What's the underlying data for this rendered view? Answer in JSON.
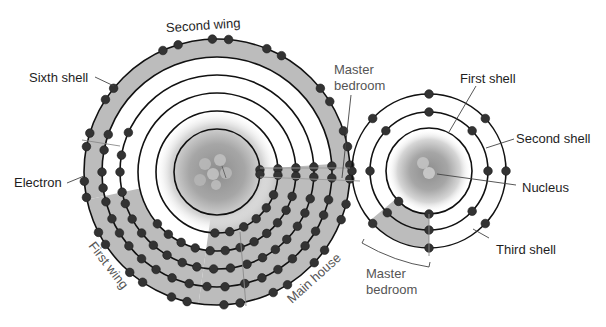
{
  "colors": {
    "ring": "#111111",
    "electron": "#333333",
    "electron_stroke": "#1a1a1a",
    "shade": "#bcbcbc",
    "divider": "#8a8a8a",
    "leader": "#444444",
    "label_dark": "#1e1e1e",
    "label_grey": "#555555"
  },
  "big_atom": {
    "cx": 217,
    "cy": 172,
    "radii": [
      43,
      61,
      79,
      97,
      115,
      133
    ],
    "nucleus_radius": 43,
    "regions": [
      {
        "name": "second-wing",
        "r_inner": 115,
        "r_outer": 133,
        "start": 168,
        "end": 372
      },
      {
        "name": "first-wing",
        "r_inner": 79,
        "r_outer": 133,
        "start": 98,
        "end": 168
      },
      {
        "name": "main-house",
        "r_inner": 43,
        "r_outer": 133,
        "start": 0,
        "end": 98
      },
      {
        "name": "master-bedroom",
        "r_inner": 43,
        "r_outer": 133,
        "start": -4,
        "end": 4
      }
    ],
    "electrons": [
      {
        "r": 43,
        "angles": [
          -3,
          3
        ]
      },
      {
        "r": 61,
        "angles": [
          -3,
          3,
          22,
          36,
          50,
          64,
          78,
          92
        ]
      },
      {
        "r": 79,
        "angles": [
          -3,
          3,
          18,
          29,
          40,
          51,
          62,
          73,
          84,
          95,
          106,
          117,
          128,
          139
        ]
      },
      {
        "r": 97,
        "angles": [
          -3,
          3,
          16,
          25,
          34,
          44,
          53,
          62,
          72,
          82,
          92,
          102,
          111,
          121,
          131,
          141,
          151,
          161,
          168,
          180,
          190,
          204
        ]
      },
      {
        "r": 115,
        "angles": [
          -3,
          3,
          14,
          22,
          31,
          40,
          49,
          58,
          67,
          76,
          86,
          95,
          104,
          113,
          122,
          131,
          140,
          148,
          156,
          165,
          172,
          180,
          191,
          199
        ]
      },
      {
        "r": 133,
        "angles": [
          -3,
          3,
          14,
          21,
          36,
          43,
          58,
          65,
          80,
          87,
          103,
          110,
          124,
          131,
          147,
          153,
          169,
          176,
          191,
          197,
          213,
          219,
          246,
          253,
          268,
          275,
          292,
          299,
          321,
          328,
          342,
          349
        ]
      }
    ]
  },
  "small_atom": {
    "cx": 429,
    "cy": 171,
    "radii": [
      43,
      59,
      77
    ],
    "nucleus_radius": 43,
    "regions": [
      {
        "name": "master-bedroom",
        "r_inner": 43,
        "r_outer": 77,
        "start": 90,
        "end": 140
      }
    ],
    "electrons": [
      {
        "r": 43,
        "angles": [
          90,
          135
        ]
      },
      {
        "r": 59,
        "angles": [
          -90,
          -43,
          0,
          43,
          90,
          135,
          180,
          223
        ]
      },
      {
        "r": 77,
        "angles": [
          -90,
          -43,
          0,
          43,
          90,
          137,
          180,
          223
        ]
      }
    ]
  },
  "labels": {
    "second_wing": "Second wing",
    "sixth_shell": "Sixth shell",
    "electron": "Electron",
    "first_wing": "First wing",
    "main_house": "Main house",
    "master_bedroom_top_line1": "Master",
    "master_bedroom_top_line2": "bedroom",
    "first_shell": "First shell",
    "second_shell": "Second shell",
    "nucleus": "Nucleus",
    "third_shell": "Third shell",
    "master_bedroom_bottom_line1": "Master",
    "master_bedroom_bottom_line2": "bedroom"
  }
}
